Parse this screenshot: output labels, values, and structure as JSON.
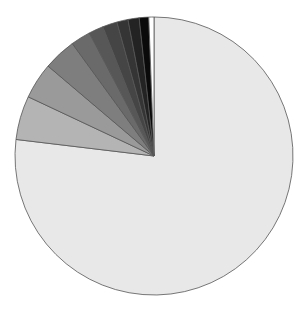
{
  "chart_data": {
    "type": "pie",
    "title": "",
    "start_angle_deg": 0,
    "direction": "clockwise",
    "center": [
      154,
      156
    ],
    "radius": 139,
    "slices": [
      {
        "label": "",
        "value": 76.9,
        "color": "#e8e8e8"
      },
      {
        "label": "",
        "value": 5.1,
        "color": "#b4b4b4"
      },
      {
        "label": "",
        "value": 4.2,
        "color": "#9a9a9a"
      },
      {
        "label": "",
        "value": 3.8,
        "color": "#7e7e7e"
      },
      {
        "label": "",
        "value": 2.3,
        "color": "#6a6a6a"
      },
      {
        "label": "",
        "value": 1.7,
        "color": "#575757"
      },
      {
        "label": "",
        "value": 1.7,
        "color": "#454545"
      },
      {
        "label": "",
        "value": 1.3,
        "color": "#353535"
      },
      {
        "label": "",
        "value": 1.3,
        "color": "#232323"
      },
      {
        "label": "",
        "value": 1.1,
        "color": "#0a0a0a"
      },
      {
        "label": "",
        "value": 0.6,
        "color": "#ffffff"
      }
    ],
    "legend": null,
    "stroke_color": "#555555"
  }
}
